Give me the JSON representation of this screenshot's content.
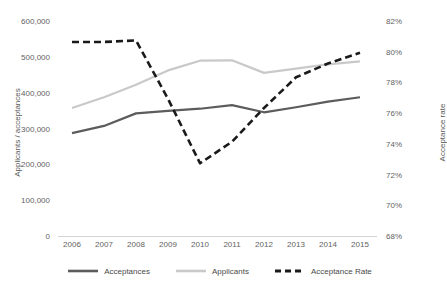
{
  "chart_data": {
    "type": "line",
    "title": "",
    "xlabel": "",
    "ylabel": "Applicants / acceptances",
    "y2label": "Acceptance rate",
    "categories": [
      "2006",
      "2007",
      "2008",
      "2009",
      "2010",
      "2011",
      "2012",
      "2013",
      "2014",
      "2015"
    ],
    "ylim": [
      0,
      600000
    ],
    "y2lim": [
      68,
      82
    ],
    "yticks": [
      "0",
      "100,000",
      "200,000",
      "300,000",
      "400,000",
      "500,000",
      "600,000"
    ],
    "ytick_values": [
      0,
      100000,
      200000,
      300000,
      400000,
      500000,
      600000
    ],
    "y2ticks": [
      "68%",
      "70%",
      "72%",
      "74%",
      "76%",
      "78%",
      "80%",
      "82%"
    ],
    "y2tick_values": [
      68,
      70,
      72,
      74,
      76,
      78,
      80,
      82
    ],
    "grid": false,
    "legend_position": "bottom",
    "series": [
      {
        "name": "Acceptances",
        "axis": "left",
        "style": "solid",
        "color": "#5c5c5c",
        "values": [
          290000,
          310000,
          345000,
          352000,
          358000,
          368000,
          348000,
          362000,
          378000,
          390000
        ]
      },
      {
        "name": "Applicants",
        "axis": "left",
        "style": "solid",
        "color": "#c9c9c9",
        "values": [
          360000,
          390000,
          425000,
          465000,
          492000,
          493000,
          458000,
          470000,
          482000,
          490000
        ]
      },
      {
        "name": "Acceptance Rate",
        "axis": "right",
        "style": "dashed",
        "color": "#1a1a1a",
        "values": [
          80.7,
          80.7,
          80.8,
          77.0,
          72.8,
          74.2,
          76.4,
          78.4,
          79.3,
          80.0
        ]
      }
    ]
  },
  "axes": {
    "left_title": "Applicants / acceptances",
    "right_title": "Acceptance rate"
  },
  "legend": {
    "items": [
      {
        "label": "Acceptances"
      },
      {
        "label": "Applicants"
      },
      {
        "label": "Acceptance Rate"
      }
    ]
  },
  "colors": {
    "acceptances": "#5c5c5c",
    "applicants": "#c9c9c9",
    "acceptance_rate": "#1a1a1a",
    "axis": "#d4d4d4",
    "text": "#5f5f5f"
  }
}
